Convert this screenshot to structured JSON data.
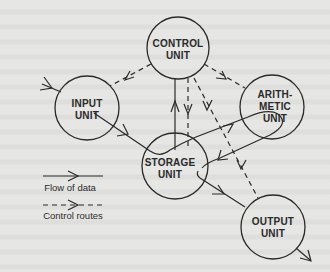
{
  "diagram": {
    "nodes": [
      {
        "id": "control",
        "lines": [
          "CONTROL",
          "UNIT"
        ]
      },
      {
        "id": "input",
        "lines": [
          "INPUT",
          "UNIT"
        ]
      },
      {
        "id": "arithmetic",
        "lines": [
          "ARITH-",
          "METIC",
          "UNIT"
        ]
      },
      {
        "id": "storage",
        "lines": [
          "STORAGE",
          "UNIT"
        ]
      },
      {
        "id": "output",
        "lines": [
          "OUTPUT",
          "UNIT"
        ]
      }
    ],
    "edges": [
      {
        "from": "external",
        "to": "input",
        "type": "data"
      },
      {
        "from": "input",
        "to": "storage",
        "type": "data"
      },
      {
        "from": "storage",
        "to": "control",
        "type": "data"
      },
      {
        "from": "storage",
        "to": "arithmetic",
        "type": "data"
      },
      {
        "from": "arithmetic",
        "to": "storage",
        "type": "data"
      },
      {
        "from": "storage",
        "to": "output",
        "type": "data"
      },
      {
        "from": "output",
        "to": "external",
        "type": "data"
      },
      {
        "from": "control",
        "to": "input",
        "type": "control"
      },
      {
        "from": "control",
        "to": "arithmetic",
        "type": "control"
      },
      {
        "from": "control",
        "to": "storage",
        "type": "control"
      },
      {
        "from": "control",
        "to": "output",
        "type": "control"
      }
    ]
  },
  "legend": {
    "data_flow_label": "Flow of data",
    "control_label": "Control routes"
  }
}
